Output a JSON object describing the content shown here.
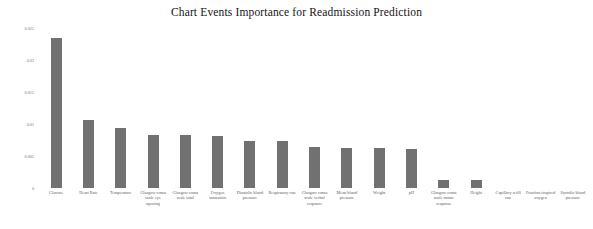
{
  "chart_data": {
    "type": "bar",
    "title": "Chart Events Importance for Readmission Prediction",
    "xlabel": "",
    "ylabel": "",
    "ylim": [
      0,
      0.025
    ],
    "grid": false,
    "legend": null,
    "orientation": "vertical",
    "bar_color": "#717171",
    "y_ticks": [
      "0.025",
      "0.02",
      "0.015",
      "0.01",
      "0.005",
      "0"
    ],
    "y_tick_values": [
      0.025,
      0.02,
      0.015,
      0.01,
      0.005,
      0
    ],
    "categories": [
      "Glucose",
      "Heart Rate",
      "Temperature",
      "Glasgow coma scale eye opening",
      "Glasgow coma scale total",
      "Oxygen saturation",
      "Diastolic blood pressure",
      "Respiratory rate",
      "Glasgow coma scale verbal response",
      "Mean blood pressure",
      "Weight",
      "pH",
      "Glasgow coma scale motor response",
      "Height",
      "Capillary refill rate",
      "Fraction inspired oxygen",
      "Systolic blood pressure"
    ],
    "values": [
      0.0234,
      0.0107,
      0.0093,
      0.0083,
      0.0083,
      0.0082,
      0.0074,
      0.0074,
      0.0064,
      0.0062,
      0.0062,
      0.0061,
      0.0013,
      0.0012,
      0.0,
      0.0,
      0.0
    ]
  },
  "figure": {
    "background_color": "#ffffff",
    "axis_label_color": "#5d5d5d"
  }
}
